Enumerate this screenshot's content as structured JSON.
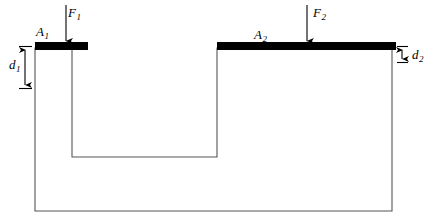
{
  "diagram": {
    "type": "physics-schematic",
    "background_color": "#ffffff",
    "stroke_color": "#555555",
    "piston_color": "#000000",
    "canvas": {
      "width": 439,
      "height": 224
    }
  },
  "labels": {
    "area_left": {
      "symbol": "A",
      "subscript": "1",
      "text": "A1"
    },
    "force_left": {
      "symbol": "F",
      "subscript": "1",
      "text": "F1"
    },
    "area_right": {
      "symbol": "A",
      "subscript": "2",
      "text": "A2"
    },
    "force_right": {
      "symbol": "F",
      "subscript": "2",
      "text": "F2"
    },
    "depth_left": {
      "symbol": "d",
      "subscript": "1",
      "text": "d1"
    },
    "depth_right": {
      "symbol": "d",
      "subscript": "2",
      "text": "d2"
    }
  },
  "label_text": {
    "A1_base": "A",
    "A1_sub": "1",
    "F1_base": "F",
    "F1_sub": "1",
    "A2_base": "A",
    "A2_sub": "2",
    "F2_base": "F",
    "F2_sub": "2",
    "d1_base": "d",
    "d1_sub": "1",
    "d2_base": "d",
    "d2_sub": "2"
  },
  "geometry": {
    "vessel_outline_points": "35,48 35,211 392,211 392,48 217,48 217,157 72,157 72,48 35,48",
    "left_piston": {
      "x": 35,
      "y": 42,
      "width": 53,
      "height": 8
    },
    "right_piston": {
      "x": 217,
      "y": 42,
      "width": 179,
      "height": 8
    },
    "force_arrow_left": {
      "x": 66,
      "y_top": 5,
      "y_bottom": 44
    },
    "force_arrow_right": {
      "x": 307,
      "y_top": 5,
      "y_bottom": 44
    },
    "dimension_d1": {
      "x": 25,
      "y_top": 46,
      "y_bottom": 88
    },
    "dimension_d2": {
      "x": 402,
      "y_top": 46,
      "y_bottom": 62
    }
  }
}
